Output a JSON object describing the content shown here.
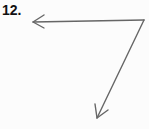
{
  "problem": {
    "number": "12.",
    "figure": "angle",
    "rays": [
      {
        "name": "left-ray",
        "direction": "left"
      },
      {
        "name": "down-ray",
        "direction": "down-left"
      }
    ],
    "stroke_color": "#666666"
  }
}
